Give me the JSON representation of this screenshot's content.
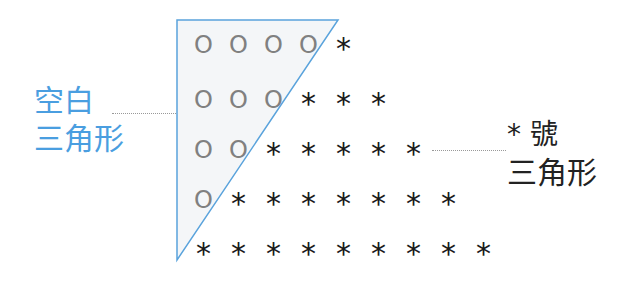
{
  "colors": {
    "triangle_stroke": "#5aa3dc",
    "triangle_fill": "#f4f6f8",
    "left_label": "#4a9ee0",
    "right_label": "#222222",
    "circle": "#808080",
    "star": "#1a1a1a"
  },
  "left_label": {
    "line1": "空白",
    "line2": "三角形"
  },
  "right_label": {
    "line1": "*  號",
    "line2": "三角形"
  },
  "rows": [
    {
      "circles": 4,
      "stars": 1,
      "cells": [
        "O",
        "O",
        "O",
        "O",
        "*"
      ]
    },
    {
      "circles": 3,
      "stars": 3,
      "cells": [
        "O",
        "O",
        "O",
        "*",
        "*",
        "*"
      ]
    },
    {
      "circles": 2,
      "stars": 5,
      "cells": [
        "O",
        "O",
        "*",
        "*",
        "*",
        "*",
        "*"
      ]
    },
    {
      "circles": 1,
      "stars": 7,
      "cells": [
        "O",
        "*",
        "*",
        "*",
        "*",
        "*",
        "*",
        "*"
      ]
    },
    {
      "circles": 0,
      "stars": 9,
      "cells": [
        "*",
        "*",
        "*",
        "*",
        "*",
        "*",
        "*",
        "*",
        "*"
      ]
    }
  ]
}
